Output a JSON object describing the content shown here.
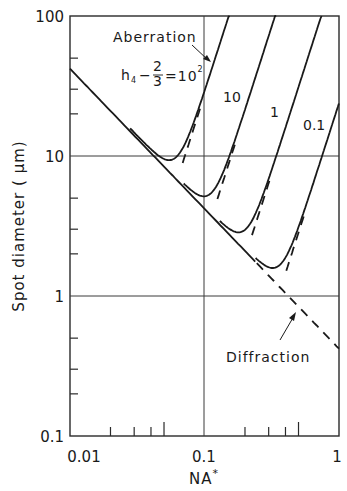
{
  "chart_data": {
    "type": "line",
    "title": "",
    "xlabel": "NA*",
    "ylabel": "Spot diameter ( µm)",
    "xscale": "log",
    "yscale": "log",
    "xlim": [
      0.01,
      1
    ],
    "ylim": [
      0.1,
      100
    ],
    "x_ticks": [
      "0.01",
      "0.1",
      "1"
    ],
    "y_ticks": [
      "0.1",
      "1",
      "10",
      "100"
    ],
    "grid": "major decades only",
    "legend": "none (inline curve labels)",
    "series": [
      {
        "name": "Diffraction",
        "style": "solid then dashed beyond tangent points",
        "x": [
          0.01,
          0.02,
          0.05,
          0.1,
          0.2,
          0.5,
          1.0
        ],
        "y": [
          42,
          21,
          8.4,
          4.2,
          2.1,
          0.84,
          0.42
        ]
      },
      {
        "name": "h4 - 2/3 = 10^2",
        "x": [
          0.01,
          0.02,
          0.03,
          0.04,
          0.05,
          0.06,
          0.07,
          0.08,
          0.1,
          0.12,
          0.14,
          0.154
        ],
        "y": [
          42,
          21,
          14.1,
          11.3,
          10.9,
          11.7,
          13.7,
          16.7,
          27.5,
          47.4,
          75.2,
          100
        ]
      },
      {
        "name": "10",
        "x": [
          0.02,
          0.05,
          0.08,
          0.1,
          0.12,
          0.15,
          0.2,
          0.25,
          0.3,
          0.34
        ],
        "y": [
          21,
          8.4,
          5.4,
          4.9,
          5.7,
          9.6,
          20.7,
          39.8,
          68.6,
          100
        ]
      },
      {
        "name": "1",
        "x": [
          0.05,
          0.1,
          0.15,
          0.18,
          0.2,
          0.25,
          0.3,
          0.4,
          0.5,
          0.6,
          0.75
        ],
        "y": [
          8.4,
          4.2,
          2.9,
          2.6,
          2.7,
          4.3,
          6.9,
          15.3,
          29.7,
          51.2,
          100
        ]
      },
      {
        "name": "0.1",
        "x": [
          0.1,
          0.2,
          0.3,
          0.35,
          0.4,
          0.5,
          0.6,
          0.7,
          0.8,
          0.9,
          1.0
        ],
        "y": [
          4.2,
          2.1,
          1.46,
          1.38,
          1.72,
          3.0,
          4.96,
          7.8,
          11.6,
          16.6,
          22.7
        ]
      }
    ],
    "annotations": [
      {
        "text": "Aberration",
        "arrow_to": "top of 10^2 curve"
      },
      {
        "text": "h4 - 2/3 = 10^2",
        "target": "first curve"
      },
      {
        "text": "10",
        "target": "second curve"
      },
      {
        "text": "1",
        "target": "third curve"
      },
      {
        "text": "0.1",
        "target": "fourth curve"
      },
      {
        "text": "Diffraction",
        "arrow_to": "dashed diffraction line"
      }
    ]
  },
  "labels": {
    "y_100": "100",
    "y_10": "10",
    "y_1": "1",
    "y_01": "0.1",
    "x_001": "0.01",
    "x_01": "0.1",
    "x_1": "1",
    "xlabel_main": "NA",
    "xlabel_sup": "*",
    "ylabel": "Spot diameter ( µm)",
    "aberration": "Aberration",
    "diffraction": "Diffraction",
    "h_label_h": "h",
    "h_label_sub": "4",
    "h_label_minus": "−",
    "h_label_num": "2",
    "h_label_den": "3",
    "h_label_eq": "=10",
    "h_label_exp": "2",
    "c10": "10",
    "c1": "1",
    "c01": "0.1"
  },
  "colors": {
    "ink": "#1a1a1a",
    "grid": "#3a3a3a",
    "background": "#ffffff"
  }
}
